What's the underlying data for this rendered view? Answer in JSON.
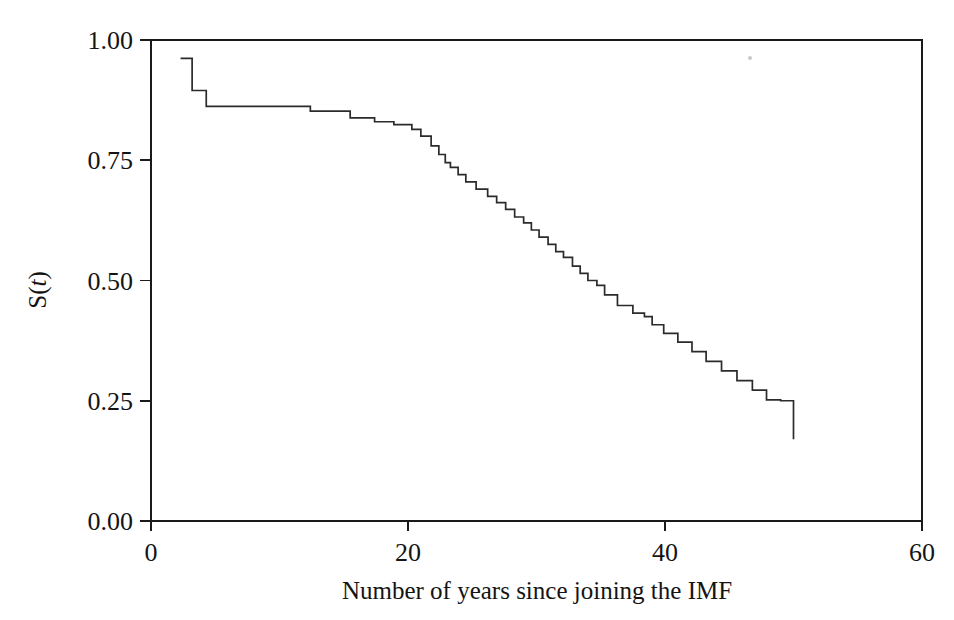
{
  "figure": {
    "background_color": "#ffffff",
    "line_color": "#2b2b2b",
    "axis_color": "#1a1a1a",
    "width": 954,
    "height": 620
  },
  "axes": {
    "y_label_prefix": "S(",
    "y_label_var": "t",
    "y_label_suffix": ")",
    "y_label_full": "S(t)",
    "x_label": "Number of years since joining the IMF",
    "y_ticks": [
      "0.00",
      "0.25",
      "0.50",
      "0.75",
      "1.00"
    ],
    "x_ticks": [
      "0",
      "20",
      "40",
      "60"
    ]
  },
  "chart_data": {
    "type": "line",
    "subtype": "kaplan-meier-step",
    "title": "",
    "xlabel": "Number of years since joining the IMF",
    "ylabel": "S(t)",
    "xlim": [
      0,
      60
    ],
    "ylim": [
      0.0,
      1.0
    ],
    "xticks": [
      0,
      20,
      40,
      60
    ],
    "yticks": [
      0.0,
      0.25,
      0.5,
      0.75,
      1.0
    ],
    "grid": false,
    "legend": null,
    "step_mode": "post",
    "x": [
      2.3,
      3.2,
      3.6,
      4.3,
      5.2,
      12.4,
      15.5,
      17.4,
      18.9,
      20.3,
      21.0,
      21.8,
      22.4,
      22.9,
      23.3,
      23.9,
      24.5,
      25.3,
      26.2,
      26.9,
      27.6,
      28.3,
      29.0,
      29.6,
      30.2,
      30.9,
      31.5,
      32.1,
      32.8,
      33.4,
      34.0,
      34.7,
      35.3,
      36.3,
      37.5,
      38.4,
      39.0,
      39.9,
      41.0,
      42.1,
      43.2,
      44.4,
      45.6,
      46.8,
      47.9,
      49.0,
      50.0,
      50.0
    ],
    "y": [
      0.962,
      0.962,
      0.895,
      0.895,
      0.862,
      0.862,
      0.852,
      0.838,
      0.83,
      0.824,
      0.814,
      0.8,
      0.78,
      0.762,
      0.745,
      0.735,
      0.72,
      0.705,
      0.69,
      0.675,
      0.662,
      0.648,
      0.632,
      0.62,
      0.605,
      0.59,
      0.575,
      0.56,
      0.548,
      0.53,
      0.515,
      0.5,
      0.49,
      0.47,
      0.448,
      0.432,
      0.425,
      0.408,
      0.39,
      0.372,
      0.352,
      0.332,
      0.312,
      0.292,
      0.272,
      0.252,
      0.25,
      0.17
    ],
    "points": [
      {
        "t": 2.3,
        "s": 0.962
      },
      {
        "t": 3.2,
        "s": 0.895
      },
      {
        "t": 3.6,
        "s": 0.895
      },
      {
        "t": 4.3,
        "s": 0.862
      },
      {
        "t": 5.2,
        "s": 0.862
      },
      {
        "t": 12.4,
        "s": 0.852
      },
      {
        "t": 15.5,
        "s": 0.838
      },
      {
        "t": 17.4,
        "s": 0.83
      },
      {
        "t": 18.9,
        "s": 0.824
      },
      {
        "t": 20.3,
        "s": 0.814
      },
      {
        "t": 21.0,
        "s": 0.8
      },
      {
        "t": 21.8,
        "s": 0.78
      },
      {
        "t": 22.4,
        "s": 0.762
      },
      {
        "t": 22.9,
        "s": 0.745
      },
      {
        "t": 23.3,
        "s": 0.735
      },
      {
        "t": 23.9,
        "s": 0.72
      },
      {
        "t": 24.5,
        "s": 0.705
      },
      {
        "t": 25.3,
        "s": 0.69
      },
      {
        "t": 26.2,
        "s": 0.675
      },
      {
        "t": 26.9,
        "s": 0.662
      },
      {
        "t": 27.6,
        "s": 0.648
      },
      {
        "t": 28.3,
        "s": 0.632
      },
      {
        "t": 29.0,
        "s": 0.62
      },
      {
        "t": 29.6,
        "s": 0.605
      },
      {
        "t": 30.2,
        "s": 0.59
      },
      {
        "t": 30.9,
        "s": 0.575
      },
      {
        "t": 31.5,
        "s": 0.56
      },
      {
        "t": 32.1,
        "s": 0.548
      },
      {
        "t": 32.8,
        "s": 0.53
      },
      {
        "t": 33.4,
        "s": 0.515
      },
      {
        "t": 34.0,
        "s": 0.5
      },
      {
        "t": 34.7,
        "s": 0.49
      },
      {
        "t": 35.3,
        "s": 0.47
      },
      {
        "t": 36.3,
        "s": 0.448
      },
      {
        "t": 37.5,
        "s": 0.432
      },
      {
        "t": 38.4,
        "s": 0.425
      },
      {
        "t": 39.0,
        "s": 0.408
      },
      {
        "t": 39.9,
        "s": 0.39
      },
      {
        "t": 41.0,
        "s": 0.372
      },
      {
        "t": 42.1,
        "s": 0.352
      },
      {
        "t": 43.2,
        "s": 0.332
      },
      {
        "t": 44.4,
        "s": 0.312
      },
      {
        "t": 45.6,
        "s": 0.292
      },
      {
        "t": 46.8,
        "s": 0.272
      },
      {
        "t": 47.9,
        "s": 0.252
      },
      {
        "t": 49.0,
        "s": 0.25
      },
      {
        "t": 50.0,
        "s": 0.17
      }
    ]
  }
}
